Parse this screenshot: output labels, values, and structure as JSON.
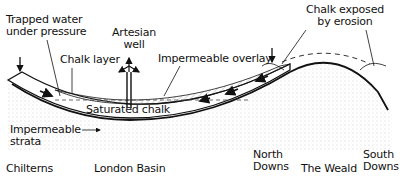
{
  "diagram": {
    "type": "geological cross-section (artesian basin)",
    "labels": {
      "trapped_water": [
        "Trapped water",
        "under pressure"
      ],
      "chalk_layer": "Chalk layer",
      "artesian_well": [
        "Artesian",
        "well"
      ],
      "impermeable_overlay": "Impermeable overlay",
      "chalk_exposed": [
        "Chalk exposed",
        "by erosion"
      ],
      "saturated_chalk": "Saturated chalk",
      "impermeable_strata": [
        "Impermeable",
        "strata"
      ]
    },
    "places": {
      "chilterns": "Chilterns",
      "london_basin": "London Basin",
      "north_downs": [
        "North",
        "Downs"
      ],
      "the_weald": "The Weald",
      "south_downs": [
        "South",
        "Downs"
      ]
    },
    "colors": {
      "ink": "#111111",
      "stipple": "#9a9a9a",
      "hatch": "#666666",
      "background": "#ffffff"
    }
  }
}
